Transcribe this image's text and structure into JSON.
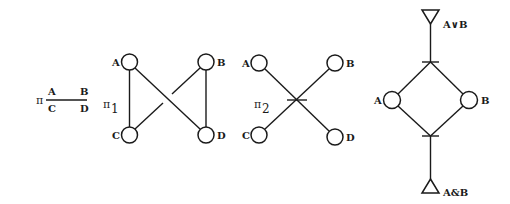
{
  "colors": {
    "ink": "#1a1a1a",
    "background": "#ffffff"
  },
  "partition": {
    "symbol": "π",
    "top_left": "A",
    "top_right": "B",
    "bottom_left": "C",
    "bottom_right": "D"
  },
  "graph_pi1": {
    "symbol": "π",
    "subscript": "1",
    "nodes": {
      "a": "A",
      "b": "B",
      "c": "C",
      "d": "D"
    },
    "edges": [
      "A-C",
      "B-D",
      "A-D",
      "B-C (crossing, broken)"
    ]
  },
  "graph_pi2": {
    "symbol": "π",
    "subscript": "2",
    "nodes": {
      "a": "A",
      "b": "B",
      "c": "C",
      "d": "D"
    },
    "edges": [
      "A-D",
      "B-C (crossing, joined at tick)"
    ]
  },
  "lattice": {
    "top": "A∨B",
    "bottom": "A&B",
    "left": "A",
    "right": "B"
  }
}
